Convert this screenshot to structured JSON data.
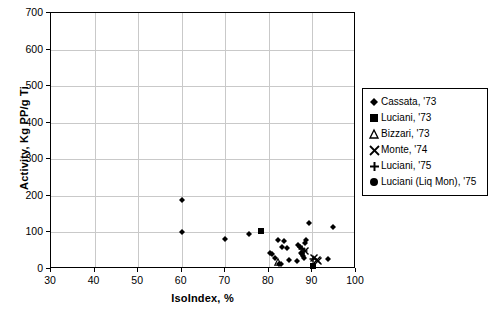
{
  "chart_data": {
    "type": "scatter",
    "title": "",
    "xlabel": "IsoIndex, %",
    "ylabel": "Activity, Kg PP/g Ti",
    "xlim": [
      30,
      100
    ],
    "ylim": [
      0,
      700
    ],
    "xticks": [
      30,
      40,
      50,
      60,
      70,
      80,
      90,
      100
    ],
    "yticks": [
      0,
      100,
      200,
      300,
      400,
      500,
      600,
      700
    ],
    "grid": true,
    "legend_position": "right",
    "series": [
      {
        "name": "Cassata, '73",
        "marker": "diamond",
        "color": "#000000",
        "points": [
          [
            60,
            190
          ],
          [
            60,
            100
          ],
          [
            70,
            83
          ],
          [
            75.5,
            95
          ],
          [
            80.2,
            45
          ],
          [
            80.8,
            42
          ],
          [
            81.5,
            30
          ],
          [
            82.0,
            80
          ],
          [
            82.4,
            13
          ],
          [
            82.8,
            14
          ],
          [
            83.0,
            60
          ],
          [
            83.4,
            76
          ],
          [
            84.2,
            57
          ],
          [
            84.6,
            25
          ],
          [
            86.4,
            22
          ],
          [
            86.8,
            66
          ],
          [
            87.2,
            60
          ],
          [
            87.4,
            45
          ],
          [
            87.6,
            40
          ],
          [
            87.9,
            36
          ],
          [
            88.0,
            30
          ],
          [
            88.3,
            70
          ],
          [
            88.6,
            80
          ],
          [
            89.3,
            125
          ],
          [
            93.6,
            27
          ],
          [
            94.8,
            114
          ]
        ]
      },
      {
        "name": "Luciani, '73",
        "marker": "square",
        "color": "#000000",
        "points": [
          [
            78.2,
            105
          ],
          [
            90.2,
            9
          ]
        ]
      },
      {
        "name": "Bizzari, '73",
        "marker": "triangle",
        "color": "#000000",
        "points": [
          [
            82.0,
            20
          ]
        ]
      },
      {
        "name": "Monte, '74",
        "marker": "x",
        "color": "#000000",
        "points": [
          [
            88.2,
            48
          ],
          [
            90.4,
            30
          ],
          [
            91.0,
            25
          ],
          [
            91.2,
            22
          ]
        ]
      },
      {
        "name": "Luciani, '75",
        "marker": "plus",
        "color": "#000000",
        "points": [
          [
            87.6,
            55
          ],
          [
            88.0,
            50
          ],
          [
            90.2,
            28
          ]
        ]
      },
      {
        "name": "Luciani (Liq Mon), '75",
        "marker": "circle",
        "color": "#000000",
        "points": []
      }
    ]
  },
  "legend": {
    "items": [
      {
        "label": "Cassata, '73",
        "marker": "diamond"
      },
      {
        "label": "Luciani, '73",
        "marker": "square"
      },
      {
        "label": "Bizzari, '73",
        "marker": "triangle"
      },
      {
        "label": "Monte, '74",
        "marker": "x"
      },
      {
        "label": "Luciani, '75",
        "marker": "plus"
      },
      {
        "label": "Luciani (Liq Mon), '75",
        "marker": "circle"
      }
    ]
  },
  "colors": {
    "marker": "#000000",
    "grid": "#c9c9c9",
    "axis": "#000000",
    "background": "#ffffff"
  }
}
